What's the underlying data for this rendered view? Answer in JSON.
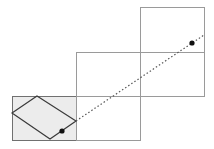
{
  "diagram": {
    "colors": {
      "background": "#ffffff",
      "grid_line": "#9a9a9a",
      "shaded_fill": "#ececec",
      "rhombus_stroke": "#3a3a3a",
      "dotted_line": "#555555",
      "point": "#111111"
    },
    "cells": [
      {
        "id": "bottom-left",
        "x": 12,
        "y": 96,
        "w": 64,
        "h": 44,
        "shaded": true
      },
      {
        "id": "bottom-middle",
        "x": 76,
        "y": 96,
        "w": 64,
        "h": 44,
        "shaded": false
      },
      {
        "id": "middle-middle",
        "x": 76,
        "y": 52,
        "w": 64,
        "h": 44,
        "shaded": false
      },
      {
        "id": "middle-right",
        "x": 140,
        "y": 52,
        "w": 64,
        "h": 44,
        "shaded": false
      },
      {
        "id": "top-right",
        "x": 140,
        "y": 7,
        "w": 64,
        "h": 45,
        "shaded": false
      }
    ],
    "rhombus": {
      "top": [
        37,
        96
      ],
      "right": [
        76,
        121
      ],
      "bottom": [
        50,
        139
      ],
      "left": [
        12,
        113
      ]
    },
    "points": [
      {
        "id": "start-point",
        "x": 62,
        "y": 131
      },
      {
        "id": "end-point",
        "x": 192,
        "y": 43
      }
    ],
    "dotted_path": {
      "from": [
        76,
        121
      ],
      "to": [
        204,
        35
      ]
    }
  }
}
